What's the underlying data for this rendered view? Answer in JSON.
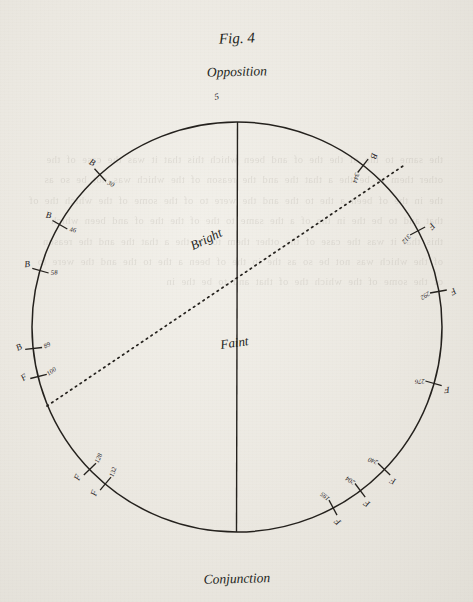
{
  "figure": {
    "title": "Fig. 4",
    "top_label": "Opposition",
    "bottom_label": "Conjunction",
    "upper_region_label": "Bright",
    "lower_region_label": "Faint",
    "top_tick_symbol": "5"
  },
  "chart_data": {
    "type": "scatter",
    "title": "Fig. 4",
    "xlabel": "",
    "ylabel": "",
    "axis_endpoints": {
      "top": "Opposition",
      "bottom": "Conjunction"
    },
    "regions": [
      {
        "name": "Bright",
        "position": "above dotted chord"
      },
      {
        "name": "Faint",
        "position": "below dotted chord"
      }
    ],
    "chord": {
      "style": "dotted",
      "from": "lower-left circumference",
      "to": "upper-right circumference",
      "label": "Bright"
    },
    "grid": false,
    "legend": false,
    "marks": [
      {
        "value": "5",
        "symbol": "",
        "angle_deg": 2,
        "side": "top"
      },
      {
        "value": "30",
        "symbol": "B",
        "angle_deg": 318,
        "side": "upper-left"
      },
      {
        "value": "46",
        "symbol": "B",
        "angle_deg": 300,
        "side": "upper-left"
      },
      {
        "value": "58",
        "symbol": "B",
        "angle_deg": 286,
        "side": "left"
      },
      {
        "value": "89",
        "symbol": "B",
        "angle_deg": 264,
        "side": "left"
      },
      {
        "value": "100",
        "symbol": "F",
        "angle_deg": 256,
        "side": "left"
      },
      {
        "value": "128",
        "symbol": "F",
        "angle_deg": 226,
        "side": "lower-left"
      },
      {
        "value": "132",
        "symbol": "F",
        "angle_deg": 220,
        "side": "lower-left"
      },
      {
        "value": "195",
        "symbol": "F",
        "angle_deg": 152,
        "side": "lower-right"
      },
      {
        "value": "204",
        "symbol": "F",
        "angle_deg": 143,
        "side": "lower-right"
      },
      {
        "value": "240",
        "symbol": "F",
        "angle_deg": 134,
        "side": "lower-right"
      },
      {
        "value": "276",
        "symbol": "F",
        "angle_deg": 106,
        "side": "right"
      },
      {
        "value": "292",
        "symbol": "F",
        "angle_deg": 80,
        "side": "right"
      },
      {
        "value": "312",
        "symbol": "F",
        "angle_deg": 62,
        "side": "upper-right"
      },
      {
        "value": "344",
        "symbol": "B",
        "angle_deg": 38,
        "side": "upper-right"
      }
    ]
  },
  "bleed_text": "the same to the of the the of and been which this that it was the case of the other them to be the a that the and the reason of the which was not be so as the in the of been a the to the and the were to of the some of the which the of that and to be the in the of a the same to the of the the of and been which this that it was the case of the other them to be the a that the and the reason of the which was not be so as the in the of been a the to the and the were to of the some of the which the of that and to be the in"
}
